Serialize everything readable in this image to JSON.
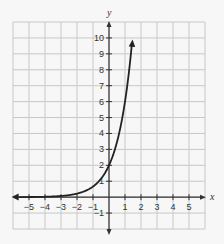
{
  "chart_data": {
    "type": "line",
    "title": "",
    "xlabel": "x",
    "ylabel": "y",
    "xlim": [
      -6,
      6
    ],
    "ylim": [
      -2,
      11
    ],
    "grid": true,
    "x_ticks": [
      -5,
      -4,
      -3,
      -2,
      -1,
      1,
      2,
      3,
      4,
      5
    ],
    "y_ticks": [
      -1,
      1,
      2,
      3,
      4,
      5,
      6,
      7,
      8,
      9,
      10
    ],
    "series": [
      {
        "name": "y = 2·3^x",
        "x": [
          -6,
          -5,
          -4,
          -3,
          -2,
          -1,
          0,
          0.5,
          1,
          1.25,
          1.45
        ],
        "y": [
          0.003,
          0.008,
          0.025,
          0.074,
          0.222,
          0.667,
          2,
          3.46,
          6,
          7.9,
          10.5
        ]
      }
    ],
    "annotations": []
  },
  "colors": {
    "grid": "#c8c8c8",
    "axis": "#333333",
    "curve": "#222222",
    "background": "#f7f7f7"
  }
}
